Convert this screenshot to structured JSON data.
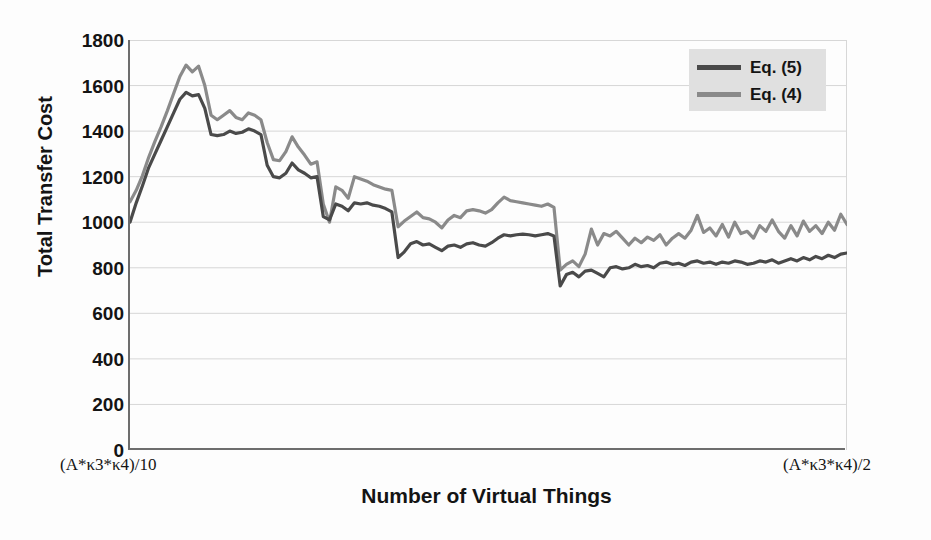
{
  "chart_data": {
    "type": "line",
    "title": "",
    "xlabel": "Number of Virtual Things",
    "ylabel": "Total Transfer Cost",
    "ylim": [
      0,
      1800
    ],
    "ytick_labels": [
      "1800",
      "1600",
      "1400",
      "1200",
      "1000",
      "800",
      "600",
      "400",
      "200",
      "0"
    ],
    "ytick_values": [
      1800,
      1600,
      1400,
      1200,
      1000,
      800,
      600,
      400,
      200,
      0
    ],
    "grid": true,
    "grid_axis": "y",
    "xlim_labels": {
      "left": "(A*κ3*κ4)/10",
      "right": "(A*κ3*κ4)/2"
    },
    "legend_position": "top-right",
    "series": [
      {
        "name": "Eq. (5)",
        "color": "#4a4a4a",
        "values": [
          1000,
          1085,
          1160,
          1240,
          1300,
          1360,
          1420,
          1480,
          1540,
          1570,
          1555,
          1560,
          1500,
          1385,
          1380,
          1385,
          1400,
          1390,
          1395,
          1410,
          1400,
          1385,
          1250,
          1200,
          1195,
          1215,
          1260,
          1230,
          1215,
          1195,
          1200,
          1025,
          1010,
          1080,
          1070,
          1050,
          1085,
          1080,
          1085,
          1075,
          1070,
          1060,
          1045,
          845,
          870,
          905,
          915,
          900,
          905,
          890,
          875,
          895,
          900,
          890,
          905,
          910,
          900,
          895,
          910,
          930,
          945,
          940,
          945,
          948,
          945,
          940,
          945,
          950,
          940,
          720,
          770,
          780,
          760,
          785,
          790,
          775,
          760,
          800,
          805,
          795,
          800,
          815,
          805,
          810,
          800,
          820,
          825,
          815,
          820,
          810,
          825,
          830,
          820,
          825,
          815,
          825,
          820,
          830,
          825,
          815,
          820,
          830,
          825,
          835,
          820,
          830,
          840,
          830,
          845,
          835,
          850,
          840,
          855,
          845,
          860,
          865
        ]
      },
      {
        "name": "Eq. (4)",
        "color": "#8a8a8a",
        "values": [
          1090,
          1140,
          1205,
          1285,
          1355,
          1420,
          1490,
          1565,
          1640,
          1690,
          1660,
          1685,
          1600,
          1470,
          1450,
          1470,
          1490,
          1460,
          1450,
          1480,
          1470,
          1450,
          1350,
          1275,
          1270,
          1310,
          1375,
          1330,
          1295,
          1255,
          1265,
          1080,
          1000,
          1155,
          1140,
          1105,
          1200,
          1190,
          1180,
          1165,
          1155,
          1145,
          1140,
          980,
          1005,
          1025,
          1045,
          1020,
          1015,
          1000,
          975,
          1010,
          1030,
          1020,
          1050,
          1055,
          1050,
          1040,
          1055,
          1085,
          1110,
          1095,
          1090,
          1085,
          1080,
          1075,
          1070,
          1080,
          1065,
          790,
          815,
          830,
          805,
          860,
          970,
          900,
          950,
          940,
          960,
          930,
          900,
          930,
          910,
          935,
          920,
          945,
          900,
          930,
          950,
          930,
          965,
          1030,
          955,
          975,
          940,
          990,
          935,
          1000,
          950,
          960,
          930,
          985,
          960,
          1010,
          960,
          930,
          985,
          940,
          1005,
          960,
          985,
          950,
          1000,
          965,
          1035,
          990
        ]
      }
    ]
  },
  "legend": {
    "items": [
      {
        "label": "Eq. (5)"
      },
      {
        "label": "Eq. (4)"
      }
    ]
  },
  "axes": {
    "y_title": "Total Transfer Cost",
    "x_title": "Number of Virtual Things",
    "x_left": "(A*κ3*κ4)/10",
    "x_right": "(A*κ3*κ4)/2"
  },
  "colors": {
    "series_eq5": "#4a4a4a",
    "series_eq4": "#8a8a8a",
    "grid": "#d7d7d7",
    "axis": "#6d6d6d",
    "legend_bg": "#e0e0e0",
    "text": "#141414"
  }
}
